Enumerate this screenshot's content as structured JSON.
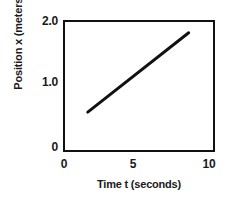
{
  "chart_data": {
    "type": "line",
    "title": "",
    "xlabel": "Time t (seconds)",
    "ylabel": "Position x (meters)",
    "xlim": [
      0,
      10
    ],
    "ylim": [
      0,
      2.0
    ],
    "xticks": [
      {
        "value": 0,
        "label": "0"
      },
      {
        "value": 5,
        "label": "5"
      },
      {
        "value": 10,
        "label": "10"
      }
    ],
    "yticks": [
      {
        "value": 2.0,
        "label": "2.0"
      },
      {
        "value": 1.0,
        "label": "1.0"
      },
      {
        "value": 0,
        "label": "0"
      }
    ],
    "grid": false,
    "legend": null,
    "series": [
      {
        "name": "position",
        "color": "#111111",
        "linewidth": 3,
        "x": [
          1.6,
          8.7
        ],
        "values": [
          0.54,
          1.84
        ]
      }
    ]
  }
}
